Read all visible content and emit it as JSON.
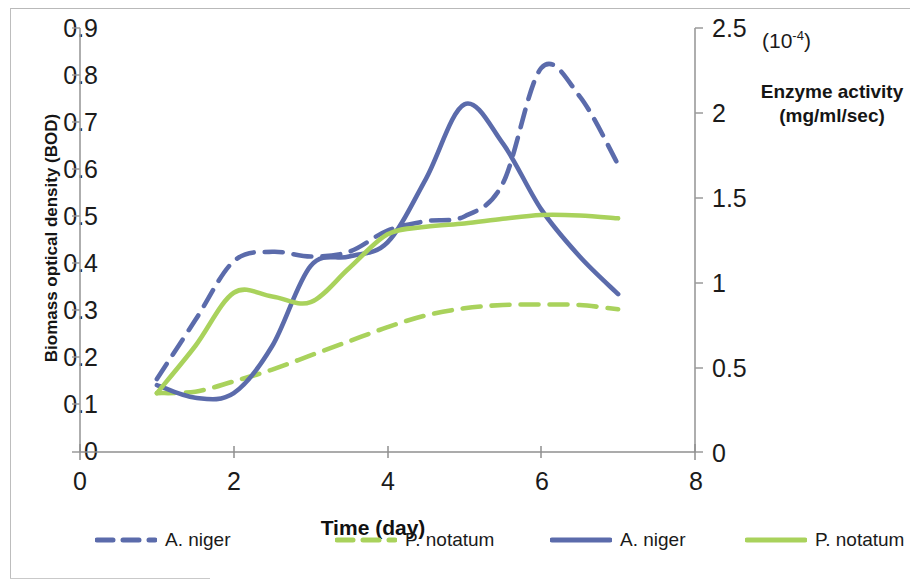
{
  "axes": {
    "left": {
      "title": "Biomass optical density (BOD)",
      "ticks": [
        "0.9",
        "0.8",
        "0.7",
        "0.6",
        "0.5",
        "0.4",
        "0.3",
        "0.2",
        "0.1",
        "0"
      ]
    },
    "right": {
      "title": "Enzyme activity\n(mg/ml/sec)",
      "title_line1": "Enzyme activity",
      "title_line2": "(mg/ml/sec)",
      "exponent_note": "(10",
      "exponent_sup": "-4",
      "exponent_close": ")",
      "ticks": [
        "2.5",
        "2",
        "1.5",
        "1",
        "0.5",
        "0"
      ]
    },
    "x": {
      "title": "Time (day)",
      "ticks": [
        "0",
        "2",
        "4",
        "6",
        "8"
      ]
    }
  },
  "legend": [
    {
      "name": "legend-a-niger-dashed",
      "label": "A. niger",
      "style": "dashed",
      "color": "#5b6bab"
    },
    {
      "name": "legend-p-notatum-dashed",
      "label": "P. notatum",
      "style": "dashed",
      "color": "#a9d25c"
    },
    {
      "name": "legend-a-niger-solid",
      "label": "A. niger",
      "style": "solid",
      "color": "#5b6bab"
    },
    {
      "name": "legend-p-notatum-solid",
      "label": "P. notatum",
      "style": "solid",
      "color": "#a9d25c"
    }
  ],
  "colors": {
    "blue": "#5b6bab",
    "green": "#a9d25c",
    "axis": "#8c8c8c",
    "text": "#1b1b1b"
  },
  "chart_data": {
    "type": "line",
    "title": "",
    "xlabel": "Time (day)",
    "ylabel": "Biomass optical density (BOD)",
    "y2label": "Enzyme activity (mg/ml/sec)",
    "y2_scale_note": "(10^-4)",
    "xlim": [
      0,
      8
    ],
    "ylim": [
      0,
      0.9
    ],
    "y2lim": [
      0,
      2.5
    ],
    "xticks": [
      0,
      2,
      4,
      6,
      8
    ],
    "yticks": [
      0,
      0.1,
      0.2,
      0.3,
      0.4,
      0.5,
      0.6,
      0.7,
      0.8,
      0.9
    ],
    "y2ticks": [
      0,
      0.5,
      1,
      1.5,
      2,
      2.5
    ],
    "grid": false,
    "legend_position": "bottom",
    "x": [
      1,
      1.5,
      2,
      2.5,
      3,
      3.5,
      4,
      4.5,
      5,
      5.5,
      6,
      6.5,
      7
    ],
    "series": [
      {
        "name": "A. niger",
        "axis": "right",
        "style": "dashed",
        "color": "#5b6bab",
        "units": "enzyme activity (10^-4 mg/ml/sec)",
        "values_left_scale": [
          0.155,
          0.28,
          0.405,
          0.425,
          0.415,
          0.425,
          0.47,
          0.49,
          0.5,
          0.57,
          0.815,
          0.755,
          0.61
        ],
        "values": [
          0.43,
          0.78,
          1.13,
          1.18,
          1.15,
          1.18,
          1.31,
          1.36,
          1.39,
          1.58,
          2.26,
          2.1,
          1.69
        ]
      },
      {
        "name": "P. notatum",
        "axis": "right",
        "style": "dashed",
        "color": "#a9d25c",
        "units": "enzyme activity (10^-4 mg/ml/sec)",
        "values_left_scale": [
          0.125,
          0.128,
          0.15,
          0.175,
          0.205,
          0.235,
          0.265,
          0.29,
          0.305,
          0.312,
          0.313,
          0.312,
          0.303
        ],
        "values": [
          0.35,
          0.36,
          0.42,
          0.49,
          0.57,
          0.65,
          0.74,
          0.81,
          0.85,
          0.87,
          0.87,
          0.87,
          0.84
        ]
      },
      {
        "name": "A. niger",
        "axis": "left",
        "style": "solid",
        "color": "#5b6bab",
        "units": "BOD",
        "values": [
          0.142,
          0.115,
          0.125,
          0.225,
          0.395,
          0.415,
          0.445,
          0.58,
          0.738,
          0.655,
          0.515,
          0.415,
          0.335
        ]
      },
      {
        "name": "P. notatum",
        "axis": "left",
        "style": "solid",
        "color": "#a9d25c",
        "units": "BOD",
        "values": [
          0.125,
          0.225,
          0.338,
          0.33,
          0.318,
          0.39,
          0.462,
          0.478,
          0.485,
          0.495,
          0.503,
          0.502,
          0.496
        ]
      }
    ]
  }
}
